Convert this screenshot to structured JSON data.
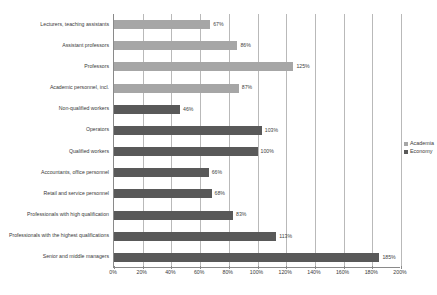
{
  "chart_data": {
    "type": "bar",
    "orientation": "horizontal",
    "title": "",
    "xlabel": "",
    "ylabel": "",
    "xlim": [
      0,
      200
    ],
    "grid": true,
    "legend_position": "right",
    "xticks": [
      "0%",
      "20%",
      "40%",
      "60%",
      "80%",
      "100%",
      "120%",
      "140%",
      "160%",
      "180%",
      "200%"
    ],
    "xtick_values": [
      0,
      20,
      40,
      60,
      80,
      100,
      120,
      140,
      160,
      180,
      200
    ],
    "legend": [
      {
        "name": "Academia",
        "color": "#a6a6a6"
      },
      {
        "name": "Economy",
        "color": "#595959"
      }
    ],
    "categories": [
      "Lecturers, teaching assistants",
      "Assistant professors",
      "Professors",
      "Academic personnel, incl.",
      "Non-qualified workers",
      "Operators",
      "Qualified workers",
      "Accountants, office personnel",
      "Retail and service personnel",
      "Professionals with high qualification",
      "Professionals with the highest qualifications",
      "Senior and middle managers"
    ],
    "bars": [
      {
        "category": "Lecturers, teaching assistants",
        "value": 67,
        "label": "67%",
        "series": "Academia"
      },
      {
        "category": "Assistant professors",
        "value": 86,
        "label": "86%",
        "series": "Academia"
      },
      {
        "category": "Professors",
        "value": 125,
        "label": "125%",
        "series": "Academia"
      },
      {
        "category": "Academic personnel, incl.",
        "value": 87,
        "label": "87%",
        "series": "Academia"
      },
      {
        "category": "Non-qualified workers",
        "value": 46,
        "label": "46%",
        "series": "Economy"
      },
      {
        "category": "Operators",
        "value": 103,
        "label": "103%",
        "series": "Economy"
      },
      {
        "category": "Qualified workers",
        "value": 100,
        "label": "100%",
        "series": "Economy"
      },
      {
        "category": "Accountants, office personnel",
        "value": 66,
        "label": "66%",
        "series": "Economy"
      },
      {
        "category": "Retail and service personnel",
        "value": 68,
        "label": "68%",
        "series": "Economy"
      },
      {
        "category": "Professionals with high qualification",
        "value": 83,
        "label": "83%",
        "series": "Economy"
      },
      {
        "category": "Professionals with the highest qualifications",
        "value": 113,
        "label": "113%",
        "series": "Economy"
      },
      {
        "category": "Senior and middle managers",
        "value": 185,
        "label": "185%",
        "series": "Economy"
      }
    ]
  },
  "colors": {
    "academia": "#a6a6a6",
    "economy": "#595959",
    "axis": "#8a8a8a",
    "gridline": "#b9b9b9",
    "text": "#3a3a3a",
    "background": "#ffffff"
  }
}
